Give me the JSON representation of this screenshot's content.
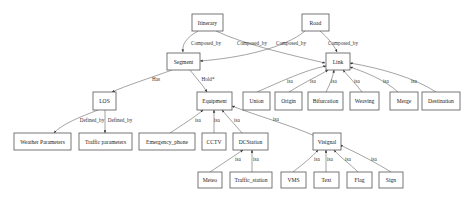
{
  "diagram": {
    "type": "class-relationship-graph",
    "nodes": {
      "itinerary": "Itinerary",
      "road": "Road",
      "segment": "Segment",
      "link": "Link",
      "los": "LOS",
      "equipment": "Equipment",
      "union": "Union",
      "origin": "Origin",
      "bifurcation": "Bifurcation",
      "weaving": "Weaving",
      "merge": "Merge",
      "destination": "Destination",
      "weather_parameters": "Weather Parameters",
      "traffic_parameters": "Traffic parameters",
      "emergency_phone": "Emergency_phone",
      "cctv": "CCTV",
      "dcstation": "DCStation",
      "visignal": "Visignal",
      "meteo": "Meteo",
      "traffic_station": "Traffic_station",
      "vms": "VMS",
      "text": "Text",
      "flag": "Flag",
      "sign": "Sign"
    },
    "edges": [
      {
        "from": "Itinerary",
        "to": "Segment",
        "label": "Composed_by"
      },
      {
        "from": "Itinerary",
        "to": "Link",
        "label": "Composed_by"
      },
      {
        "from": "Road",
        "to": "Segment",
        "label": "Composed_by"
      },
      {
        "from": "Road",
        "to": "Link",
        "label": "Composed_by"
      },
      {
        "from": "Segment",
        "to": "LOS",
        "label": "Has"
      },
      {
        "from": "Segment",
        "to": "Equipment",
        "label": "Hold*"
      },
      {
        "from": "LOS",
        "to": "Weather Parameters",
        "label": "Defined_by"
      },
      {
        "from": "LOS",
        "to": "Traffic parameters",
        "label": "Defined_by"
      },
      {
        "from": "Union",
        "to": "Link",
        "label": "isa"
      },
      {
        "from": "Origin",
        "to": "Link",
        "label": "isa"
      },
      {
        "from": "Bifurcation",
        "to": "Link",
        "label": "isa"
      },
      {
        "from": "Weaving",
        "to": "Link",
        "label": "isa"
      },
      {
        "from": "Merge",
        "to": "Link",
        "label": "isa"
      },
      {
        "from": "Destination",
        "to": "Link",
        "label": "isa"
      },
      {
        "from": "Emergency_phone",
        "to": "Equipment",
        "label": "isa"
      },
      {
        "from": "CCTV",
        "to": "Equipment",
        "label": "isa"
      },
      {
        "from": "DCStation",
        "to": "Equipment",
        "label": "isa"
      },
      {
        "from": "Visignal",
        "to": "Equipment",
        "label": "isa"
      },
      {
        "from": "Meteo",
        "to": "DCStation",
        "label": "isa"
      },
      {
        "from": "Traffic_station",
        "to": "DCStation",
        "label": "isa"
      },
      {
        "from": "VMS",
        "to": "Visignal",
        "label": "isa"
      },
      {
        "from": "Text",
        "to": "Visignal",
        "label": "isa"
      },
      {
        "from": "Flag",
        "to": "Visignal",
        "label": "isa"
      },
      {
        "from": "Sign",
        "to": "Visignal",
        "label": "isa"
      }
    ]
  }
}
